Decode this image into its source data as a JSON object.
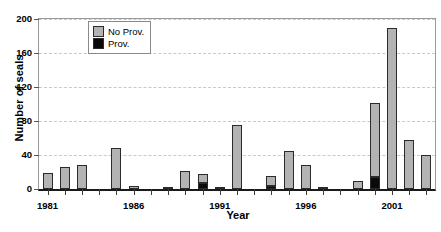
{
  "chart_data": {
    "type": "bar",
    "subtype": "stacked-vertical",
    "title": "",
    "xlabel": "Year",
    "ylabel": "Number of seals",
    "ylim": [
      0,
      200
    ],
    "yticks": [
      0,
      40,
      80,
      120,
      160,
      200
    ],
    "xticks": [
      "1981",
      "1986",
      "1991",
      "1996",
      "2001"
    ],
    "grid": "horizontal-dashed",
    "legend_position": "top-left-inside",
    "categories": [
      "1981",
      "1982",
      "1983",
      "1984",
      "1985",
      "1986",
      "1987",
      "1988",
      "1989",
      "1990",
      "1991",
      "1992",
      "1993",
      "1994",
      "1995",
      "1996",
      "1997",
      "1998",
      "1999",
      "2000",
      "2001",
      "2002",
      "2003"
    ],
    "series": [
      {
        "name": "No Prov.",
        "color": "#b3b3b3",
        "values": [
          19,
          26,
          28,
          0,
          48,
          3,
          0,
          2,
          21,
          11,
          2,
          75,
          0,
          11,
          45,
          28,
          1,
          0,
          10,
          87,
          190,
          58,
          40
        ]
      },
      {
        "name": "Prov.",
        "color": "#0a0a0a",
        "values": [
          0,
          0,
          0,
          0,
          0,
          0,
          0,
          0,
          0,
          7,
          0,
          0,
          0,
          4,
          0,
          0,
          0,
          0,
          0,
          14,
          0,
          0,
          0
        ]
      }
    ],
    "totals": [
      19,
      26,
      28,
      0,
      48,
      3,
      0,
      2,
      21,
      18,
      2,
      75,
      0,
      15,
      45,
      28,
      1,
      0,
      10,
      101,
      190,
      58,
      40
    ]
  },
  "legend": {
    "items": [
      {
        "label": "No Prov.",
        "swatch": "noprov"
      },
      {
        "label": "Prov.",
        "swatch": "prov"
      }
    ]
  },
  "axes": {
    "y_title": "Number of seals",
    "x_title": "Year"
  }
}
